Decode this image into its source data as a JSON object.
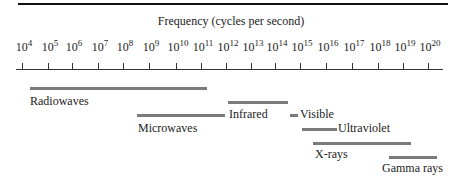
{
  "diagram": {
    "title": "Frequency (cycles per second)",
    "axis": {
      "scale": "log10",
      "ticks": [
        {
          "base": "10",
          "exp": "4",
          "x": 22
        },
        {
          "base": "10",
          "exp": "5",
          "x": 48
        },
        {
          "base": "10",
          "exp": "6",
          "x": 72
        },
        {
          "base": "10",
          "exp": "7",
          "x": 98
        },
        {
          "base": "10",
          "exp": "8",
          "x": 123
        },
        {
          "base": "10",
          "exp": "9",
          "x": 149
        },
        {
          "base": "10",
          "exp": "10",
          "x": 176
        },
        {
          "base": "10",
          "exp": "11",
          "x": 201
        },
        {
          "base": "10",
          "exp": "12",
          "x": 226
        },
        {
          "base": "10",
          "exp": "13",
          "x": 251
        },
        {
          "base": "10",
          "exp": "14",
          "x": 275
        },
        {
          "base": "10",
          "exp": "15",
          "x": 300
        },
        {
          "base": "10",
          "exp": "16",
          "x": 326
        },
        {
          "base": "10",
          "exp": "17",
          "x": 352
        },
        {
          "base": "10",
          "exp": "18",
          "x": 378
        },
        {
          "base": "10",
          "exp": "19",
          "x": 403
        },
        {
          "base": "10",
          "exp": "20",
          "x": 428
        }
      ]
    },
    "bands": [
      {
        "label": "Radiowaves",
        "bar_x1": 30,
        "bar_x2": 207,
        "bar_y": 87,
        "label_x": 30,
        "label_y": 94,
        "label_pos": "below"
      },
      {
        "label": "Microwaves",
        "bar_x1": 137,
        "bar_x2": 225,
        "bar_y": 114,
        "label_x": 138,
        "label_y": 121,
        "label_pos": "below"
      },
      {
        "label": "Infrared",
        "bar_x1": 228,
        "bar_x2": 288,
        "bar_y": 101,
        "label_x": 229,
        "label_y": 107,
        "label_pos": "below"
      },
      {
        "label": "Visible",
        "bar_x1": 290,
        "bar_x2": 298,
        "bar_y": 114,
        "label_x": 300,
        "label_y": 107,
        "label_pos": "right"
      },
      {
        "label": "Ultraviolet",
        "bar_x1": 302,
        "bar_x2": 337,
        "bar_y": 128,
        "label_x": 338,
        "label_y": 121,
        "label_pos": "right"
      },
      {
        "label": "X-rays",
        "bar_x1": 313,
        "bar_x2": 411,
        "bar_y": 142,
        "label_x": 315,
        "label_y": 147,
        "label_pos": "below"
      },
      {
        "label": "Gamma rays",
        "bar_x1": 389,
        "bar_x2": 437,
        "bar_y": 156,
        "label_x": 382,
        "label_y": 161,
        "label_pos": "below"
      }
    ],
    "colors": {
      "rule": "#111111",
      "axis": "#333333",
      "bar": "#7a7a7a",
      "text": "#222222"
    }
  }
}
